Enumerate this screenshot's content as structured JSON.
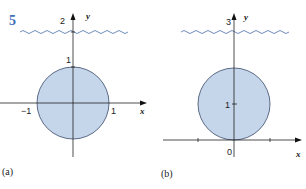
{
  "figure": {
    "number": "5",
    "number_color": "#3d6fb6",
    "circle_fill": "#c5d5ea",
    "circle_stroke": "#3a4a6a",
    "wave_color": "#4a6fa8",
    "panels": [
      {
        "caption": "(a)",
        "x_axis_label": "x",
        "y_axis_label": "y",
        "y_top_label": "2",
        "y_tick_label": "1",
        "x_neg_label": "−1",
        "x_pos_label": "1"
      },
      {
        "caption": "(b)",
        "x_axis_label": "x",
        "y_axis_label": "y",
        "y_top_label": "3",
        "y_tick_label": "1",
        "origin_label": "0"
      }
    ]
  }
}
